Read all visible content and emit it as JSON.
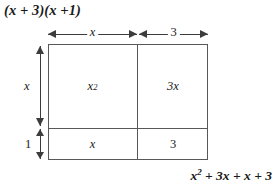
{
  "title": {
    "expression": "(x + 3)(x +1)"
  },
  "result": {
    "base": "x",
    "exponent": "2",
    "rest": " + 3x + x + 3",
    "full": "x2 + 3x + x + 3"
  },
  "dimensions": {
    "top_left_label": "x",
    "top_right_label": "3",
    "left_upper_label": "x",
    "left_lower_label": "1"
  },
  "cells": {
    "top_left": {
      "base": "x",
      "exponent": "2",
      "full": "x2"
    },
    "top_right": {
      "label": "3x"
    },
    "bottom_left": {
      "label": "x"
    },
    "bottom_right": {
      "label": "3"
    }
  },
  "colors": {
    "stroke": "#58585a",
    "arrow": "#3c3c3e",
    "text": "#1a1a1a",
    "background": "#ffffff"
  }
}
